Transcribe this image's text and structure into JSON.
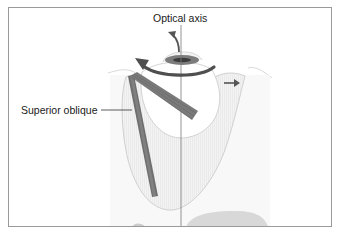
{
  "figure": {
    "labels": {
      "optical_axis": "Optical axis",
      "superior_oblique": "Superior oblique"
    },
    "colors": {
      "frame": "#9a9a9a",
      "muscle_dark": "#6e6e6e",
      "muscle_mid": "#8a8a8a",
      "arrow": "#555555",
      "orbit_fill": "#f1f1f1",
      "outline": "#c8c8c8",
      "axis_line": "#7a7a7a"
    },
    "annotations": [
      {
        "type": "arrow",
        "name": "intorsion-rotation-arrow",
        "direction": "counter-clockwise"
      },
      {
        "type": "arrow",
        "name": "upward-arrow",
        "direction": "up"
      },
      {
        "type": "arrow",
        "name": "lateral-arrow",
        "direction": "right"
      }
    ]
  }
}
